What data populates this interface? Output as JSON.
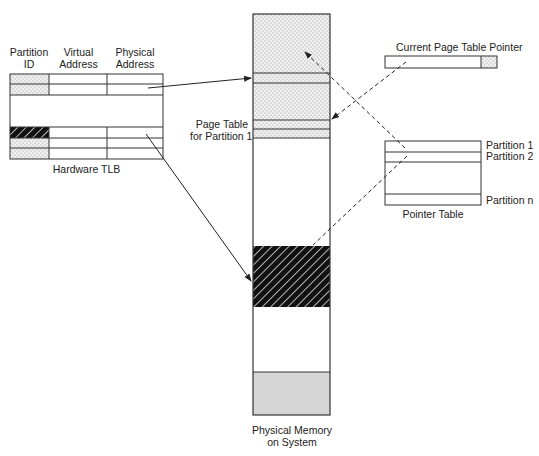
{
  "tlb": {
    "headers": [
      {
        "line1": "Partition",
        "line2": "ID"
      },
      {
        "line1": "Virtual",
        "line2": "Address"
      },
      {
        "line1": "Physical",
        "line2": "Address"
      }
    ],
    "caption": "Hardware TLB",
    "rows": [
      {
        "partition_fill": "dotted"
      },
      {
        "partition_fill": "dotted"
      },
      {
        "partition_fill": "blank"
      },
      {
        "partition_fill": "hatched"
      },
      {
        "partition_fill": "dotted"
      },
      {
        "partition_fill": "dotted"
      }
    ]
  },
  "memory": {
    "caption_line1": "Physical Memory",
    "caption_line2": "on System",
    "page_table_label_line1": "Page Table",
    "page_table_label_line2": "for Partition 1",
    "regions": [
      {
        "name": "partition-1-region",
        "fill": "dotted"
      },
      {
        "name": "free-region",
        "fill": "white"
      },
      {
        "name": "partition-hatched-region",
        "fill": "hatched"
      },
      {
        "name": "free-region-2",
        "fill": "white"
      },
      {
        "name": "system-region",
        "fill": "gray"
      }
    ]
  },
  "pointer": {
    "title": "Current Page Table Pointer"
  },
  "pointer_table": {
    "caption": "Pointer Table",
    "entries": [
      "Partition 1",
      "Partition 2",
      "Partition n"
    ]
  },
  "colors": {
    "line": "#333333",
    "dot_fill": "#e8e8e8",
    "gray_fill": "#d4d4d4",
    "hatch_bg": "#111111",
    "hatch_line": "#ffffff"
  }
}
